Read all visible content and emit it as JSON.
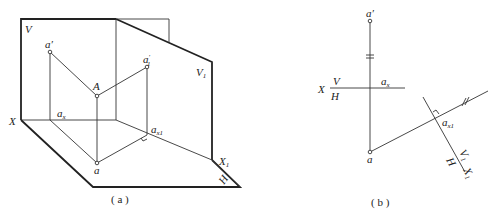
{
  "figure_a": {
    "caption": "( a )",
    "labels": {
      "V": "V",
      "V1_main": "V",
      "V1_sub": "1",
      "a_prime_main": "a",
      "a_prime_mark": "′",
      "a1_prime_main": "a",
      "a1_prime_mark": "′",
      "a1_prime_sub": "1",
      "A": "A",
      "ax_main": "a",
      "ax_sub": "x",
      "ax1_main": "a",
      "ax1_sub": "x1",
      "X": "X",
      "X1_main": "X",
      "X1_sub": "1",
      "a": "a",
      "H": "H"
    }
  },
  "figure_b": {
    "caption": "( b )",
    "labels": {
      "a_prime_main": "a",
      "a_prime_mark": "′",
      "X": "X",
      "V": "V",
      "H": "H",
      "ax_main": "a",
      "ax_sub": "x",
      "ax1_main": "a",
      "ax1_sub": "x1",
      "a": "a",
      "V1_main": "V",
      "V1_sub": "1",
      "H2": "H",
      "X1_main": "X",
      "X1_sub": "1"
    }
  }
}
